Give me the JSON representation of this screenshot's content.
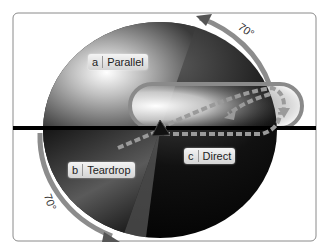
{
  "diagram": {
    "sectors": [
      {
        "letter": "a",
        "name": "Parallel"
      },
      {
        "letter": "b",
        "name": "Teardrop"
      },
      {
        "letter": "c",
        "name": "Direct"
      }
    ],
    "angles": [
      {
        "value": "70°",
        "position": "top-right"
      },
      {
        "value": "70°",
        "position": "bottom-left"
      }
    ],
    "colors": {
      "frame": "#888888",
      "track": "#808080",
      "dashed_path": "#9a9a9a",
      "dark": "#000000",
      "light": "#f0f0f0"
    }
  }
}
